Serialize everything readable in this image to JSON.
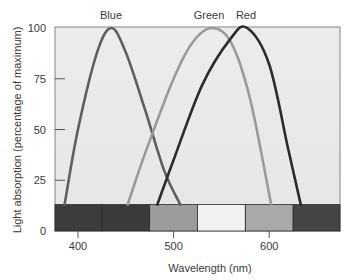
{
  "chart_data": {
    "type": "line",
    "title": "",
    "xlabel": "Wavelength (nm)",
    "ylabel": "Light absorption (percentage of maximum)",
    "xlim": [
      376,
      674
    ],
    "ylim": [
      0,
      100
    ],
    "x_ticks": [
      400,
      500,
      600
    ],
    "y_ticks": [
      0,
      25,
      50,
      75,
      100
    ],
    "grid": false,
    "legend": "curve labels above peaks",
    "series": [
      {
        "name": "Blue",
        "color": "#5f5f5f",
        "peak_nm": 435,
        "x": [
          386,
          400,
          420,
          435,
          450,
          470,
          490,
          507
        ],
        "y": [
          13,
          50,
          88,
          100,
          88,
          60,
          30,
          13
        ]
      },
      {
        "name": "Green",
        "color": "#9a9a9a",
        "peak_nm": 540,
        "x": [
          452,
          470,
          500,
          520,
          540,
          560,
          580,
          602
        ],
        "y": [
          13,
          38,
          75,
          93,
          100,
          93,
          65,
          13
        ]
      },
      {
        "name": "Red",
        "color": "#2c2c2c",
        "peak_nm": 577,
        "x": [
          483,
          500,
          530,
          560,
          577,
          600,
          620,
          633
        ],
        "y": [
          13,
          35,
          72,
          95,
          100,
          82,
          40,
          13
        ]
      }
    ],
    "spectrum_bar": {
      "y_range": [
        0,
        13
      ],
      "segments": [
        {
          "from_nm": 376,
          "to_nm": 425,
          "color": "#3c3c3c"
        },
        {
          "from_nm": 425,
          "to_nm": 475,
          "color": "#3a3a3a"
        },
        {
          "from_nm": 475,
          "to_nm": 525,
          "color": "#9c9c9c"
        },
        {
          "from_nm": 525,
          "to_nm": 575,
          "color": "#f2f2f2"
        },
        {
          "from_nm": 575,
          "to_nm": 625,
          "color": "#a9a9a9"
        },
        {
          "from_nm": 625,
          "to_nm": 674,
          "color": "#444444"
        }
      ]
    }
  },
  "labels": {
    "xlabel": "Wavelength (nm)",
    "ylabel": "Light absorption (percentage of maximum)",
    "y_ticks": [
      "100",
      "75",
      "50",
      "25",
      "0"
    ],
    "x_ticks": [
      "400",
      "500",
      "600"
    ],
    "curve_blue": "Blue",
    "curve_green": "Green",
    "curve_red": "Red"
  },
  "colors": {
    "plot_bg": "#e9e9e9",
    "axis": "#555555"
  }
}
